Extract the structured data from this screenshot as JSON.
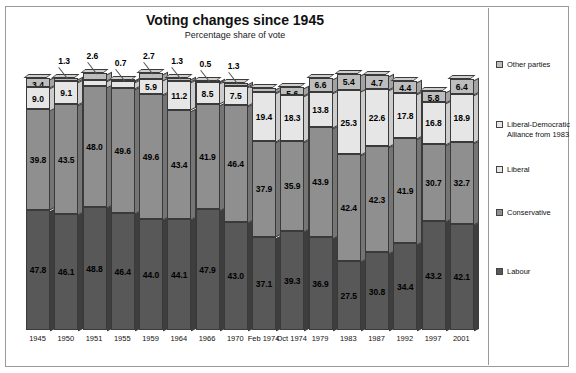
{
  "chart_data": {
    "type": "bar",
    "title": "Voting changes since 1945",
    "subtitle": "Percentage share of vote",
    "xlabel": "",
    "ylabel": "",
    "ylim": [
      0,
      100
    ],
    "grid": false,
    "stacked": true,
    "legend_position": "right",
    "categories": [
      "1945",
      "1950",
      "1951",
      "1955",
      "1959",
      "1964",
      "1966",
      "1970",
      "Feb 1974",
      "Oct 1974",
      "1979",
      "1983",
      "1987",
      "1992",
      "1997",
      "2001"
    ],
    "series": [
      {
        "name": "Labour",
        "color": "#585858",
        "values": [
          47.8,
          46.1,
          48.8,
          46.4,
          44.0,
          44.1,
          47.9,
          43.0,
          37.1,
          39.3,
          36.9,
          27.5,
          30.8,
          34.4,
          43.2,
          42.1
        ]
      },
      {
        "name": "Conservative",
        "color": "#8f8f8f",
        "values": [
          39.8,
          43.5,
          48.0,
          49.6,
          49.6,
          43.4,
          41.9,
          46.4,
          37.9,
          35.9,
          43.9,
          42.4,
          42.3,
          41.9,
          30.7,
          32.7
        ]
      },
      {
        "name": "Liberal",
        "color": "#e6e6e6",
        "values": [
          9.0,
          9.1,
          2.6,
          2.7,
          5.9,
          11.2,
          8.5,
          7.5,
          19.4,
          18.3,
          13.8,
          null,
          null,
          null,
          null,
          null
        ]
      },
      {
        "name": "Liberal-Democratic Alliance from 1983",
        "color": "#e6e6e6",
        "values": [
          null,
          null,
          null,
          null,
          null,
          null,
          null,
          null,
          null,
          null,
          null,
          25.3,
          22.6,
          17.8,
          16.8,
          18.9
        ]
      },
      {
        "name": "Other parties",
        "color": "#bdbdbd",
        "values": [
          3.4,
          1.3,
          2.6,
          0.7,
          2.7,
          1.3,
          0.5,
          1.3,
          1.7,
          3.1,
          5.6,
          6.6,
          5.4,
          4.7,
          4.4,
          5.8
        ]
      }
    ],
    "other_parties_displayed": [
      3.4,
      1.3,
      2.6,
      0.7,
      2.7,
      1.3,
      0.5,
      1.3,
      1.7,
      3.1,
      5.6,
      6.6,
      5.4,
      4.7,
      4.4,
      5.8
    ],
    "labels_inside": {
      "labour": [
        "47.8",
        "46.1",
        "48.8",
        "46.4",
        "44.0",
        "44.1",
        "47.9",
        "43.0",
        "37.1",
        "39.3",
        "36.9",
        "27.5",
        "30.8",
        "34.4",
        "43.2",
        "42.1"
      ],
      "conservative": [
        "39.8",
        "43.5",
        "48.0",
        "49.6",
        "49.6",
        "43.4",
        "41.9",
        "46.4",
        "37.9",
        "35.9",
        "43.9",
        "42.4",
        "42.3",
        "41.9",
        "30.7",
        "32.7"
      ],
      "liberal": [
        "9.0",
        "9.1",
        "",
        "",
        "5.9",
        "11.2",
        "8.5",
        "7.5",
        "19.4",
        "18.3",
        "13.8",
        "25.3",
        "22.6",
        "17.8",
        "16.8",
        "18.9"
      ],
      "other_inside": [
        "3.4",
        "",
        "",
        "",
        "",
        "",
        "",
        "",
        "3.1",
        "5.6",
        "6.6",
        "5.4",
        "4.7",
        "4.4",
        "5.8",
        "6.4"
      ]
    },
    "callout_labels": [
      "1.3",
      "2.6",
      "0.7",
      "2.7",
      "1.3",
      "0.5",
      "1.3",
      "1.7"
    ]
  },
  "legend": {
    "items": [
      {
        "label": "Other parties",
        "color": "#bdbdbd"
      },
      {
        "label": "Liberal-Democratic Alliance from 1983",
        "color": "#e6e6e6"
      },
      {
        "label": "Liberal",
        "color": "#e6e6e6"
      },
      {
        "label": "Conservative",
        "color": "#8f8f8f"
      },
      {
        "label": "Labour",
        "color": "#585858"
      }
    ]
  }
}
